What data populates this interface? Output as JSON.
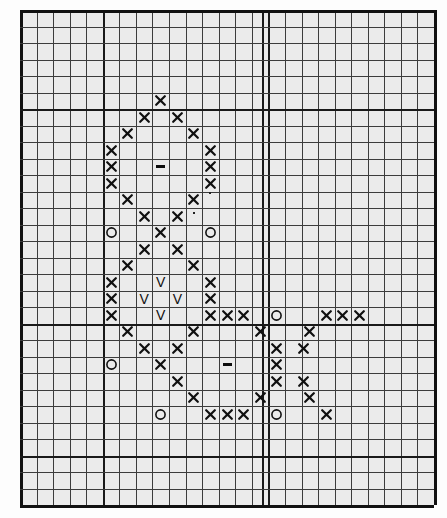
{
  "figure": {
    "kind": "hand-plotted-grid-chart",
    "background_color": "#ebebeb",
    "grid_line_color": "#3c3c3c",
    "emphasis_line_color": "#1a1a1a",
    "symbol_color": "#101010"
  },
  "chart_data": {
    "type": "scatter",
    "title": "",
    "subtitle": "",
    "xlabel": "",
    "ylabel": "",
    "grid": true,
    "legend": null,
    "plot_area": {
      "x": 20,
      "y": 10,
      "width": 414,
      "height": 495
    },
    "geometry": {
      "cols": 25,
      "rows": 30,
      "cell_width": 16.56,
      "cell_height": 16.5
    },
    "emphasis_lines": {
      "vertical_cols": [
        0,
        5,
        14.6,
        25
      ],
      "horizontal_rows": [
        0,
        6,
        19,
        27,
        30
      ]
    },
    "symbol_legend": [
      {
        "key": "x",
        "glyph": "x",
        "name": "cross-mark"
      },
      {
        "key": "o",
        "glyph": "O",
        "name": "circle-mark"
      },
      {
        "key": "v",
        "glyph": "V",
        "name": "vee-mark"
      },
      {
        "key": "dash",
        "glyph": "-",
        "name": "dash-mark"
      },
      {
        "key": "dot",
        "glyph": ".",
        "name": "dot-mark"
      }
    ],
    "marks": [
      {
        "col": 8,
        "row": 5,
        "type": "x"
      },
      {
        "col": 7,
        "row": 6,
        "type": "x"
      },
      {
        "col": 9,
        "row": 6,
        "type": "x"
      },
      {
        "col": 6,
        "row": 7,
        "type": "x"
      },
      {
        "col": 10,
        "row": 7,
        "type": "x"
      },
      {
        "col": 5,
        "row": 8,
        "type": "x"
      },
      {
        "col": 11,
        "row": 8,
        "type": "x"
      },
      {
        "col": 5,
        "row": 9,
        "type": "x"
      },
      {
        "col": 8,
        "row": 9,
        "type": "dash"
      },
      {
        "col": 11,
        "row": 9,
        "type": "x"
      },
      {
        "col": 5,
        "row": 10,
        "type": "x"
      },
      {
        "col": 11,
        "row": 10,
        "type": "x"
      },
      {
        "col": 6,
        "row": 11,
        "type": "x"
      },
      {
        "col": 10,
        "row": 11,
        "type": "x"
      },
      {
        "col": 11,
        "row": 10.6,
        "type": "dot"
      },
      {
        "col": 7,
        "row": 12,
        "type": "x"
      },
      {
        "col": 9,
        "row": 12,
        "type": "x"
      },
      {
        "col": 10,
        "row": 11.8,
        "type": "dot"
      },
      {
        "col": 5,
        "row": 13,
        "type": "o"
      },
      {
        "col": 8,
        "row": 13,
        "type": "x"
      },
      {
        "col": 11,
        "row": 13,
        "type": "o"
      },
      {
        "col": 7,
        "row": 14,
        "type": "x"
      },
      {
        "col": 9,
        "row": 14,
        "type": "x"
      },
      {
        "col": 6,
        "row": 15,
        "type": "x"
      },
      {
        "col": 10,
        "row": 15,
        "type": "x"
      },
      {
        "col": 5,
        "row": 16,
        "type": "x"
      },
      {
        "col": 8,
        "row": 16,
        "type": "v"
      },
      {
        "col": 11,
        "row": 16,
        "type": "x"
      },
      {
        "col": 5,
        "row": 17,
        "type": "x"
      },
      {
        "col": 7,
        "row": 17,
        "type": "v"
      },
      {
        "col": 9,
        "row": 17,
        "type": "v"
      },
      {
        "col": 11,
        "row": 17,
        "type": "x"
      },
      {
        "col": 5,
        "row": 18,
        "type": "x"
      },
      {
        "col": 8,
        "row": 18,
        "type": "v"
      },
      {
        "col": 11,
        "row": 18,
        "type": "x"
      },
      {
        "col": 12,
        "row": 18,
        "type": "x"
      },
      {
        "col": 13,
        "row": 18,
        "type": "x"
      },
      {
        "col": 15,
        "row": 18,
        "type": "o"
      },
      {
        "col": 18,
        "row": 18,
        "type": "x"
      },
      {
        "col": 19,
        "row": 18,
        "type": "x"
      },
      {
        "col": 20,
        "row": 18,
        "type": "x"
      },
      {
        "col": 6,
        "row": 19,
        "type": "x"
      },
      {
        "col": 10,
        "row": 19,
        "type": "x"
      },
      {
        "col": 14,
        "row": 19,
        "type": "x"
      },
      {
        "col": 17,
        "row": 19,
        "type": "x"
      },
      {
        "col": 7,
        "row": 20,
        "type": "x"
      },
      {
        "col": 9,
        "row": 20,
        "type": "x"
      },
      {
        "col": 15,
        "row": 20,
        "type": "x"
      },
      {
        "col": 16.6,
        "row": 20,
        "type": "x"
      },
      {
        "col": 5,
        "row": 21,
        "type": "o"
      },
      {
        "col": 8,
        "row": 21,
        "type": "x"
      },
      {
        "col": 12,
        "row": 21,
        "type": "dash"
      },
      {
        "col": 15,
        "row": 21,
        "type": "x"
      },
      {
        "col": 9,
        "row": 22,
        "type": "x"
      },
      {
        "col": 15,
        "row": 22,
        "type": "x"
      },
      {
        "col": 16.6,
        "row": 22,
        "type": "x"
      },
      {
        "col": 10,
        "row": 23,
        "type": "x"
      },
      {
        "col": 14,
        "row": 23,
        "type": "x"
      },
      {
        "col": 17,
        "row": 23,
        "type": "x"
      },
      {
        "col": 8,
        "row": 24,
        "type": "o"
      },
      {
        "col": 11,
        "row": 24,
        "type": "x"
      },
      {
        "col": 12,
        "row": 24,
        "type": "x"
      },
      {
        "col": 13,
        "row": 24,
        "type": "x"
      },
      {
        "col": 15,
        "row": 24,
        "type": "o"
      },
      {
        "col": 18,
        "row": 24,
        "type": "x"
      }
    ]
  }
}
